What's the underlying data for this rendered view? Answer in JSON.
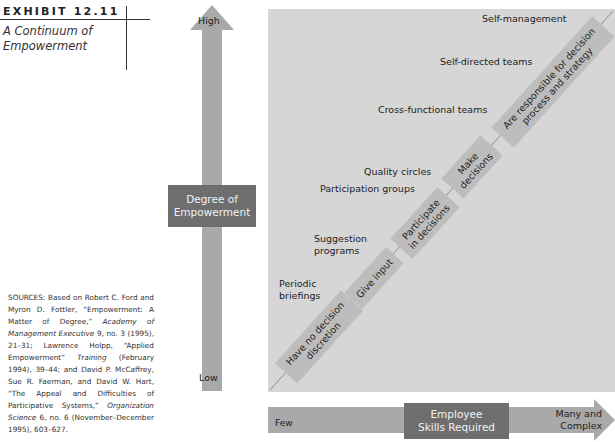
{
  "exhibit": {
    "number": "EXHIBIT 12.11",
    "title_line1": "A Continuum of",
    "title_line2": "Empowerment"
  },
  "sources": {
    "lead": "SOURCES: Based on Robert C. Ford and Myron D. Fottler, “Empowerment: A Matter of Degree,” ",
    "j1": "Academy of Management Executive",
    "t1": " 9, no. 3 (1995), 21–31; Lawrence Holpp, “Applied Empowerment” ",
    "j2": "Training",
    "t2": " (February 1994), 39–44; and David P. McCaffrey, Sue R. Faerman, and David W. Hart, “The Appeal and Difficulties of Participative Systems,” ",
    "j3": "Organization Science",
    "t3": " 6, no. 6 (November–December 1995), 603–627."
  },
  "vertical_axis": {
    "label_line1": "Degree of",
    "label_line2": "Empowerment",
    "high": "High",
    "low": "Low"
  },
  "horizontal_axis": {
    "label_line1": "Employee",
    "label_line2": "Skills Required",
    "low": "Few",
    "high_line1": "Many and",
    "high_line2": "Complex"
  },
  "practices": [
    {
      "line1": "Self-management",
      "line2": ""
    },
    {
      "line1": "Self-directed teams",
      "line2": ""
    },
    {
      "line1": "Cross-functional teams",
      "line2": ""
    },
    {
      "line1": "Quality circles",
      "line2": ""
    },
    {
      "line1": "Participation groups",
      "line2": ""
    },
    {
      "line1": "Suggestion",
      "line2": "programs"
    },
    {
      "line1": "Periodic",
      "line2": "briefings"
    }
  ],
  "stages": [
    {
      "line1": "Have no decision",
      "line2": "discretion"
    },
    {
      "line1": "Give input",
      "line2": ""
    },
    {
      "line1": "Participate",
      "line2": "in decisions"
    },
    {
      "line1": "Make",
      "line2": "decisions"
    },
    {
      "line1": "Are responsible for decision",
      "line2": "process and strategy"
    }
  ],
  "colors": {
    "panel": "#d6d6d6",
    "arrow": "#a9a9a9",
    "label_box": "#6e6e6e",
    "stage_box": "#bdbdbd"
  }
}
